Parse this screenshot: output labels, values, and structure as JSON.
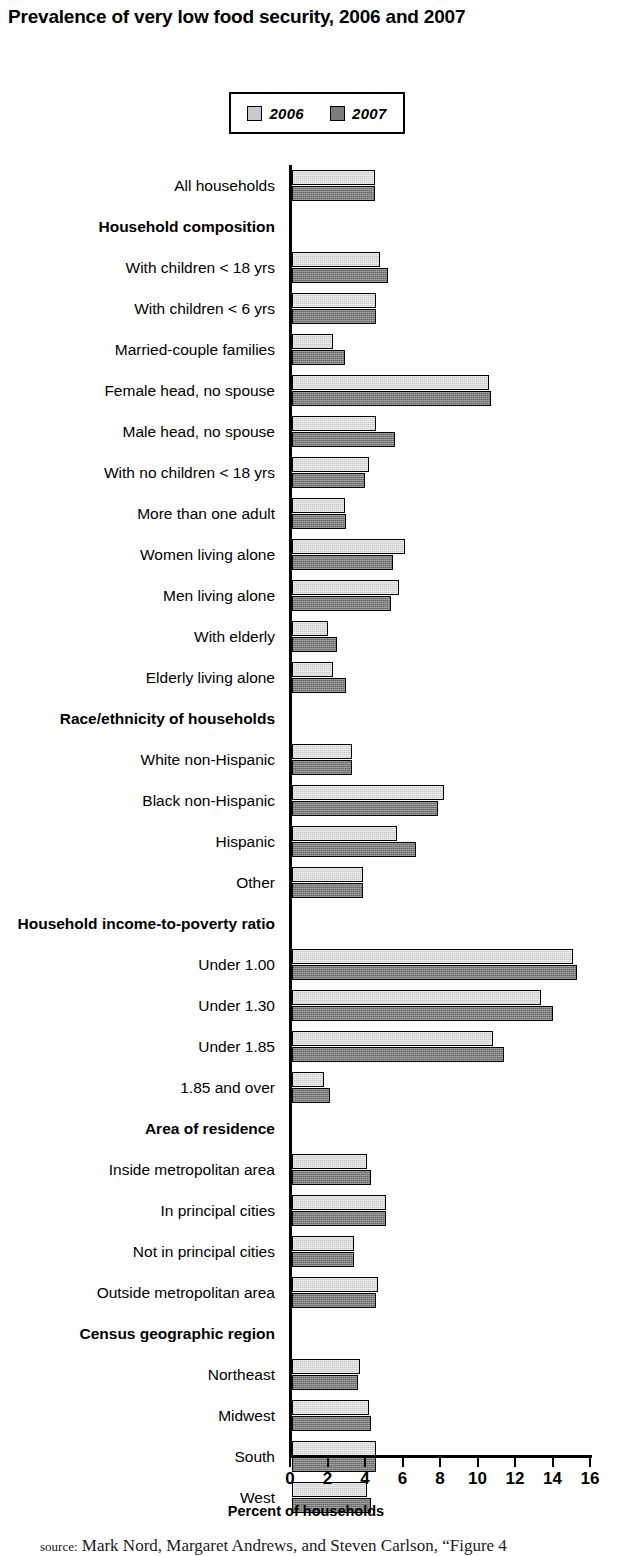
{
  "title": "Prevalence of very low food security, 2006 and 2007",
  "legend": {
    "position": "top-center",
    "entries": [
      {
        "label": "2006",
        "color": "#c9c9c9"
      },
      {
        "label": "2007",
        "color": "#7d7d7d"
      }
    ]
  },
  "axis": {
    "xlabel": "Percent of households",
    "tick_labels": [
      "0",
      "2",
      "4",
      "6",
      "8",
      "10",
      "12",
      "14",
      "16"
    ]
  },
  "source_note": {
    "prefix": "source:",
    "text": "Mark Nord, Margaret Andrews, and Steven Carlson, “Figure 4"
  },
  "chart_data": {
    "type": "bar",
    "orientation": "horizontal",
    "title": "Prevalence of very low food security, 2006 and 2007",
    "xlabel": "Percent of households",
    "ylabel": "",
    "xlim": [
      0,
      16
    ],
    "xticks": [
      0,
      2,
      4,
      6,
      8,
      10,
      12,
      14,
      16
    ],
    "grid": false,
    "legend": [
      "2006",
      "2007"
    ],
    "rows": [
      {
        "label": "All households",
        "group": false,
        "values_2006": 4.4,
        "values_2007": 4.4
      },
      {
        "label": "Household composition",
        "group": true,
        "values_2006": null,
        "values_2007": null
      },
      {
        "label": "With children < 18 yrs",
        "group": false,
        "values_2006": 4.7,
        "values_2007": 5.1
      },
      {
        "label": "With children < 6 yrs",
        "group": false,
        "values_2006": 4.5,
        "values_2007": 4.5
      },
      {
        "label": "Married-couple families",
        "group": false,
        "values_2006": 2.2,
        "values_2007": 2.8
      },
      {
        "label": "Female head, no spouse",
        "group": false,
        "values_2006": 10.5,
        "values_2007": 10.6
      },
      {
        "label": "Male head, no spouse",
        "group": false,
        "values_2006": 4.5,
        "values_2007": 5.5
      },
      {
        "label": "With no children < 18 yrs",
        "group": false,
        "values_2006": 4.1,
        "values_2007": 3.9
      },
      {
        "label": "More than one adult",
        "group": false,
        "values_2006": 2.8,
        "values_2007": 2.9
      },
      {
        "label": "Women living alone",
        "group": false,
        "values_2006": 6.0,
        "values_2007": 5.4
      },
      {
        "label": "Men living alone",
        "group": false,
        "values_2006": 5.7,
        "values_2007": 5.3
      },
      {
        "label": "With elderly",
        "group": false,
        "values_2006": 1.9,
        "values_2007": 2.4
      },
      {
        "label": "Elderly living alone",
        "group": false,
        "values_2006": 2.2,
        "values_2007": 2.9
      },
      {
        "label": "Race/ethnicity of households",
        "group": true,
        "values_2006": null,
        "values_2007": null
      },
      {
        "label": "White non-Hispanic",
        "group": false,
        "values_2006": 3.2,
        "values_2007": 3.2
      },
      {
        "label": "Black non-Hispanic",
        "group": false,
        "values_2006": 8.1,
        "values_2007": 7.8
      },
      {
        "label": "Hispanic",
        "group": false,
        "values_2006": 5.6,
        "values_2007": 6.6
      },
      {
        "label": "Other",
        "group": false,
        "values_2006": 3.8,
        "values_2007": 3.8
      },
      {
        "label": "Household income-to-poverty ratio",
        "group": true,
        "values_2006": null,
        "values_2007": null
      },
      {
        "label": "Under 1.00",
        "group": false,
        "values_2006": 15.0,
        "values_2007": 15.2
      },
      {
        "label": "Under 1.30",
        "group": false,
        "values_2006": 13.3,
        "values_2007": 13.9
      },
      {
        "label": "Under 1.85",
        "group": false,
        "values_2006": 10.7,
        "values_2007": 11.3
      },
      {
        "label": "1.85 and over",
        "group": false,
        "values_2006": 1.7,
        "values_2007": 2.0
      },
      {
        "label": "Area of residence",
        "group": true,
        "values_2006": null,
        "values_2007": null
      },
      {
        "label": "Inside metropolitan area",
        "group": false,
        "values_2006": 4.0,
        "values_2007": 4.2
      },
      {
        "label": "In principal cities",
        "group": false,
        "values_2006": 5.0,
        "values_2007": 5.0
      },
      {
        "label": "Not in principal cities",
        "group": false,
        "values_2006": 3.3,
        "values_2007": 3.3
      },
      {
        "label": "Outside metropolitan area",
        "group": false,
        "values_2006": 4.6,
        "values_2007": 4.5
      },
      {
        "label": "Census geographic region",
        "group": true,
        "values_2006": null,
        "values_2007": null
      },
      {
        "label": "Northeast",
        "group": false,
        "values_2006": 3.6,
        "values_2007": 3.5
      },
      {
        "label": "Midwest",
        "group": false,
        "values_2006": 4.1,
        "values_2007": 4.2
      },
      {
        "label": "South",
        "group": false,
        "values_2006": 4.5,
        "values_2007": 4.5
      },
      {
        "label": "West",
        "group": false,
        "values_2006": 4.0,
        "values_2007": 4.2
      }
    ]
  }
}
